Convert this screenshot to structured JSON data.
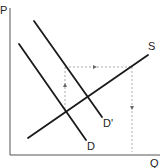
{
  "diagram": {
    "axes": {
      "y_label": "P",
      "x_label": "Q"
    },
    "curves": [
      {
        "id": "S",
        "label": "S",
        "type": "supply"
      },
      {
        "id": "D",
        "label": "D",
        "type": "demand"
      },
      {
        "id": "D_prime",
        "label": "D'",
        "type": "demand-shifted"
      }
    ],
    "guides": [
      {
        "id": "rise",
        "description": "dotted vertical arrow up from D/S intersection"
      },
      {
        "id": "shift",
        "description": "dotted horizontal arrow right"
      },
      {
        "id": "fall",
        "description": "dotted vertical arrow down"
      }
    ],
    "colors": {
      "curve": "#1a1a1a",
      "axis": "#555555",
      "guide": "#aaaaaa"
    }
  }
}
